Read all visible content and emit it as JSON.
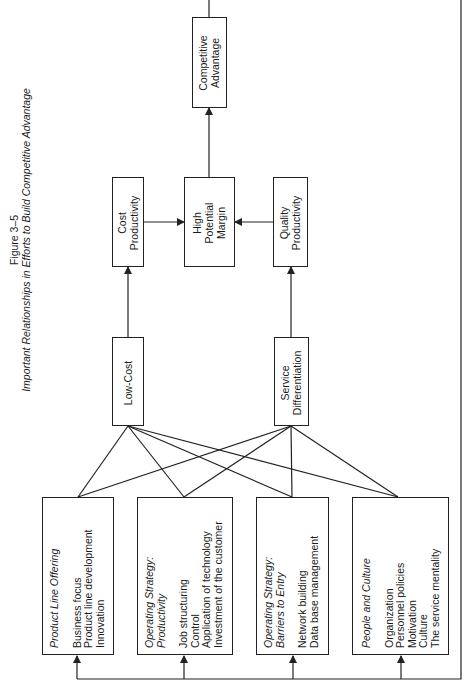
{
  "figure": {
    "number": "Figure 3–5",
    "caption": "Important Relationships in Efforts to Build Competitive Advantage"
  },
  "nodes": {
    "competitive_advantage": {
      "lines": [
        "Competitive",
        "Advantage"
      ]
    },
    "cost_productivity": {
      "lines": [
        "Cost",
        "Productivity"
      ]
    },
    "high_potential_margin": {
      "lines": [
        "High",
        "Potential",
        "Margin"
      ]
    },
    "quality_productivity": {
      "lines": [
        "Quality",
        "Productivity"
      ]
    },
    "low_cost": {
      "lines": [
        "Low-Cost"
      ]
    },
    "service_differentiation": {
      "lines": [
        "Service",
        "Differentiation"
      ]
    }
  },
  "factors": [
    {
      "title": [
        "Product Line Offering"
      ],
      "items": [
        "Business focus",
        "Product line development",
        "Innovation"
      ]
    },
    {
      "title": [
        "Operating Strategy:",
        "Productivity"
      ],
      "items": [
        "Job structuring",
        "Control",
        "Application of technology",
        "Investment of the customer"
      ]
    },
    {
      "title": [
        "Operating Strategy:",
        "Barriers to Entry"
      ],
      "items": [
        "Network building",
        "Data base management"
      ]
    },
    {
      "title": [
        "People and Culture"
      ],
      "items": [
        "Organization",
        "Personnel policies",
        "Motivation",
        "Culture",
        "The service mentality"
      ]
    }
  ],
  "edges": [
    {
      "from": "Product Line Offering",
      "to": "Low-Cost"
    },
    {
      "from": "Product Line Offering",
      "to": "Service Differentiation"
    },
    {
      "from": "Operating Strategy: Productivity",
      "to": "Low-Cost"
    },
    {
      "from": "Operating Strategy: Productivity",
      "to": "Service Differentiation"
    },
    {
      "from": "Operating Strategy: Barriers to Entry",
      "to": "Low-Cost"
    },
    {
      "from": "Operating Strategy: Barriers to Entry",
      "to": "Service Differentiation"
    },
    {
      "from": "People and Culture",
      "to": "Low-Cost"
    },
    {
      "from": "People and Culture",
      "to": "Service Differentiation"
    },
    {
      "from": "Low-Cost",
      "to": "Cost Productivity"
    },
    {
      "from": "Service Differentiation",
      "to": "Quality Productivity"
    },
    {
      "from": "Cost Productivity",
      "to": "High Potential Margin"
    },
    {
      "from": "Quality Productivity",
      "to": "High Potential Margin"
    },
    {
      "from": "High Potential Margin",
      "to": "Competitive Advantage"
    },
    {
      "from": "Competitive Advantage",
      "to": "all factors (feedback loop)"
    }
  ],
  "style": {
    "line_color": "#222222",
    "background": "#ffffff"
  }
}
